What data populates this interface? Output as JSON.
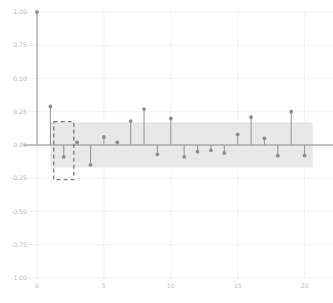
{
  "chart_data": {
    "type": "line",
    "plot_style": "stem",
    "title": "",
    "subtitle": "",
    "xlabel": "",
    "ylabel": "",
    "xlim": [
      -1.0,
      21.0
    ],
    "ylim": [
      -1.0,
      1.0
    ],
    "grid": true,
    "legend": null,
    "x": [
      0,
      1,
      2,
      3,
      4,
      5,
      6,
      7,
      8,
      9,
      10,
      11,
      12,
      13,
      14,
      15,
      16,
      17,
      18,
      19,
      20
    ],
    "values": [
      1.0,
      0.29,
      -0.09,
      0.02,
      -0.15,
      0.06,
      0.02,
      0.18,
      0.27,
      -0.07,
      0.2,
      -0.09,
      -0.05,
      -0.04,
      -0.06,
      0.08,
      0.21,
      0.05,
      -0.08,
      0.25,
      -0.08
    ],
    "series": [
      {
        "name": "autocorrelation",
        "values": [
          1.0,
          0.29,
          -0.09,
          0.02,
          -0.15,
          0.06,
          0.02,
          0.18,
          0.27,
          -0.07,
          0.2,
          -0.09,
          -0.05,
          -0.04,
          -0.06,
          0.08,
          0.21,
          0.05,
          -0.08,
          0.25,
          -0.08
        ]
      }
    ],
    "xticks": [
      0,
      5,
      10,
      15,
      20
    ],
    "xtick_labels": [
      "0",
      "5",
      "10",
      "15",
      "20"
    ],
    "yticks": [
      -1.0,
      -0.75,
      -0.5,
      -0.25,
      0.0,
      0.25,
      0.5,
      0.75,
      1.0
    ],
    "ytick_labels": [
      "-1.00",
      "-0.75",
      "-0.50",
      "-0.25",
      "0.00",
      "0.25",
      "0.50",
      "0.75",
      "1.00"
    ],
    "confidence_band": {
      "upper": 0.17,
      "lower": -0.17,
      "x_start": 1.0,
      "x_end": 20.6,
      "color": "#e8e8e8"
    },
    "highlight_box": {
      "x_center": 2,
      "x_half_width": 0.75,
      "y_top": 0.175,
      "y_bottom": -0.26,
      "style": "dashed",
      "color": "#7d7d7d"
    },
    "colors": {
      "stem": "#9a9aa0",
      "marker": "#8d8d93",
      "baseline": "#8a8a90",
      "grid": "#f2f2f4",
      "tick_text": "#b9b9bd",
      "band": "#e8e8e8",
      "background": "#ffffff"
    }
  }
}
